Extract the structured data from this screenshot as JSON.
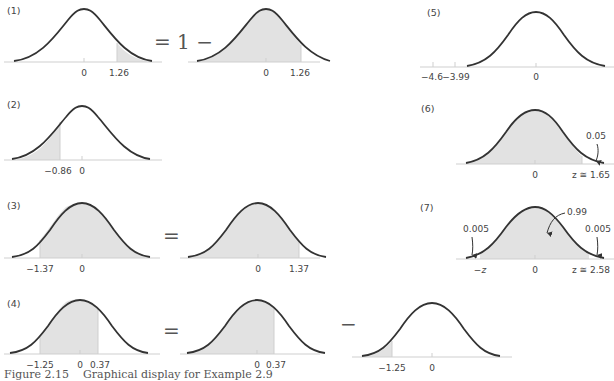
{
  "figure": {
    "caption_number": "Figure 2.15",
    "caption_text": "Graphical display for Example 2.9",
    "colors": {
      "curve": "#333333",
      "shade": "#e2e2e2",
      "axis": "#cfcfcf",
      "text": "#444444"
    }
  },
  "panels": [
    {
      "id": "1",
      "label": "(1)",
      "operators": [
        "= 1 −"
      ],
      "curves": [
        {
          "shaded": "right tail from 1.26",
          "tick_labels": [
            "0",
            "1.26"
          ]
        },
        {
          "shaded": "left of 1.26",
          "tick_labels": [
            "0",
            "1.26"
          ]
        }
      ]
    },
    {
      "id": "2",
      "label": "(2)",
      "curves": [
        {
          "shaded": "left tail to −0.86",
          "tick_labels": [
            "−0.86",
            "0"
          ]
        }
      ]
    },
    {
      "id": "3",
      "label": "(3)",
      "operators": [
        "="
      ],
      "curves": [
        {
          "shaded": "right of −1.37",
          "tick_labels": [
            "−1.37",
            "0"
          ]
        },
        {
          "shaded": "left of 1.37",
          "tick_labels": [
            "0",
            "1.37"
          ]
        }
      ]
    },
    {
      "id": "4",
      "label": "(4)",
      "operators": [
        "=",
        "−"
      ],
      "curves": [
        {
          "shaded": "between −1.25 and 0.37",
          "tick_labels": [
            "−1.25",
            "0",
            "0.37"
          ]
        },
        {
          "shaded": "left of 0.37",
          "tick_labels": [
            "0",
            "0.37"
          ]
        },
        {
          "shaded": "left tail to −1.25",
          "tick_labels": [
            "−1.25",
            "0"
          ]
        }
      ]
    },
    {
      "id": "5",
      "label": "(5)",
      "curves": [
        {
          "shaded": "none",
          "tick_labels": [
            "−4.6",
            "−3.99",
            "0"
          ]
        }
      ]
    },
    {
      "id": "6",
      "label": "(6)",
      "curves": [
        {
          "shaded": "left of 1.65",
          "tick_labels": [
            "0",
            "z ≅ 1.65"
          ],
          "annotations": [
            "0.05"
          ]
        }
      ]
    },
    {
      "id": "7",
      "label": "(7)",
      "curves": [
        {
          "shaded": "between −z and z",
          "tick_labels": [
            "−z",
            "0",
            "z ≅ 2.58"
          ],
          "annotations": [
            "0.005",
            "0.99",
            "0.005"
          ]
        }
      ]
    }
  ]
}
